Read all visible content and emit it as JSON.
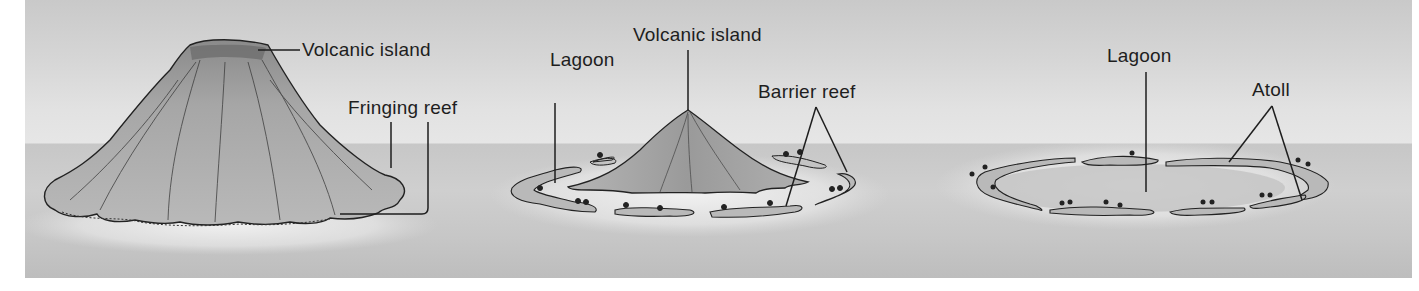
{
  "diagram": {
    "colors": {
      "sky": "#d6d6d6",
      "sea": "#c9c9c9",
      "island": "#a8a8a8",
      "reef": "#b8b8b8",
      "ink": "#1e1e1e"
    },
    "stages": [
      {
        "name": "fringing-reef-stage",
        "labels": [
          {
            "text": "Volcanic island"
          },
          {
            "text": "Fringing reef"
          }
        ]
      },
      {
        "name": "barrier-reef-stage",
        "labels": [
          {
            "text": "Lagoon"
          },
          {
            "text": "Volcanic island"
          },
          {
            "text": "Barrier reef"
          }
        ]
      },
      {
        "name": "atoll-stage",
        "labels": [
          {
            "text": "Lagoon"
          },
          {
            "text": "Atoll"
          }
        ]
      }
    ]
  }
}
